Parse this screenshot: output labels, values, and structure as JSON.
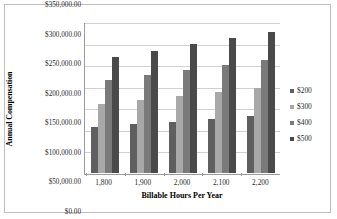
{
  "chart_data": {
    "type": "bar",
    "title": "",
    "subtitle": "",
    "xlabel": "Billable Hours Per Year",
    "ylabel": "Annual Compensation",
    "categories": [
      "1,800",
      "1,900",
      "2,000",
      "2,100",
      "2,200"
    ],
    "series": [
      {
        "name": "$200",
        "color": "#5f5f5f",
        "values": [
          108000,
          114000,
          120000,
          126000,
          132000
        ]
      },
      {
        "name": "$300",
        "color": "#a8a8a8",
        "values": [
          162000,
          171000,
          180000,
          189000,
          198000
        ]
      },
      {
        "name": "$400",
        "color": "#7a7a7a",
        "values": [
          216000,
          228000,
          240000,
          252000,
          264000
        ]
      },
      {
        "name": "$500",
        "color": "#4a4a4a",
        "values": [
          270000,
          285000,
          300000,
          315000,
          330000
        ]
      }
    ],
    "ylim": [
      0,
      350000
    ],
    "ytick_values": [
      0,
      50000,
      100000,
      150000,
      200000,
      250000,
      300000,
      350000
    ],
    "ytick_labels": [
      "$0.00",
      "$50,000.00",
      "$100,000.00",
      "$150,000.00",
      "$200,000.00",
      "$250,000.00",
      "$300,000.00",
      "$350,000.00"
    ],
    "grid": true,
    "grid_axis": "y",
    "legend_position": "right",
    "legend_entries": [
      "$200",
      "$300",
      "$400",
      "$500"
    ],
    "plot_background": "#ffffff",
    "grid_color": "#d2d2d2",
    "axis_color": "#9a9a9a",
    "border_color": "#bfbfbf"
  }
}
